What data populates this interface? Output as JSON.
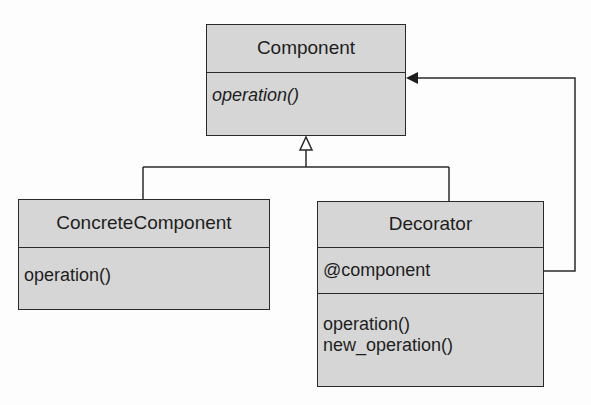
{
  "diagram": {
    "type": "uml-class",
    "classes": [
      {
        "id": "component",
        "name": "Component",
        "attributes": [],
        "operations": [
          {
            "label": "operation()",
            "abstract": true
          }
        ]
      },
      {
        "id": "concrete_component",
        "name": "ConcreteComponent",
        "attributes": [],
        "operations": [
          {
            "label": "operation()",
            "abstract": false
          }
        ]
      },
      {
        "id": "decorator",
        "name": "Decorator",
        "attributes": [
          "@component"
        ],
        "operations": [
          {
            "label": "operation()",
            "abstract": false
          },
          {
            "label": "new_operation()",
            "abstract": false
          }
        ]
      }
    ],
    "relationships": [
      {
        "type": "generalization",
        "from": "ConcreteComponent",
        "to": "Component"
      },
      {
        "type": "generalization",
        "from": "Decorator",
        "to": "Component"
      },
      {
        "type": "association",
        "from": "Decorator",
        "via": "@component",
        "to": "Component"
      }
    ]
  }
}
